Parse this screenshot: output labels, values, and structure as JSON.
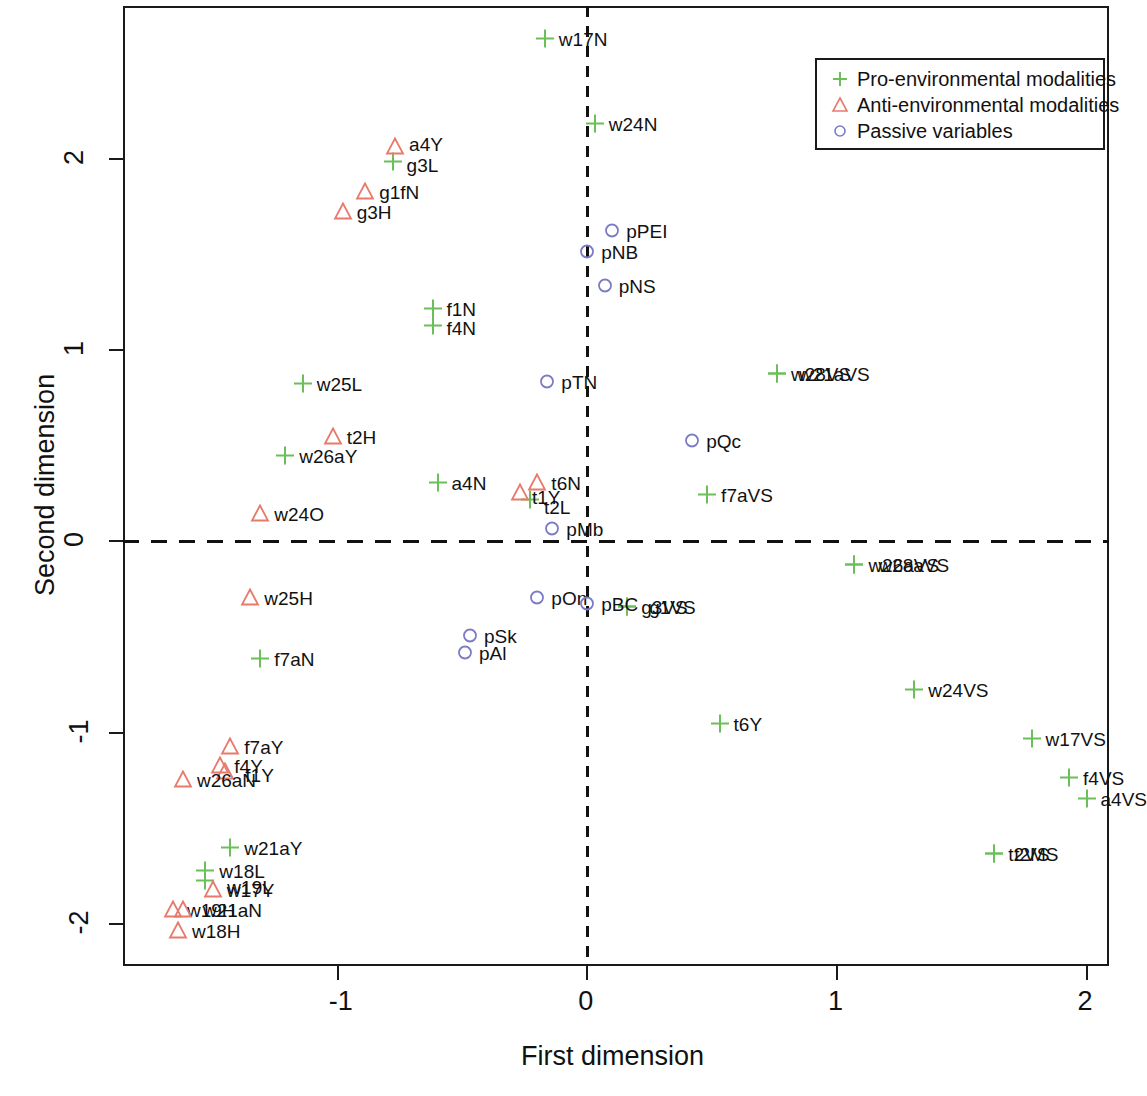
{
  "chart_data": {
    "type": "scatter",
    "title": "",
    "xlabel": "First dimension",
    "ylabel": "Second dimension",
    "xlim": [
      -1.86,
      2.09
    ],
    "ylim": [
      -2.22,
      2.8
    ],
    "xticks": [
      -1,
      0,
      1,
      2
    ],
    "xticklabels": [
      "-1",
      "0",
      "1",
      "2"
    ],
    "yticks": [
      -2,
      -1,
      0,
      1,
      2
    ],
    "yticklabels": [
      "-2",
      "-1",
      "0",
      "1",
      "2"
    ],
    "grid": false,
    "reference_lines": [
      {
        "axis": "vertical",
        "value": 0,
        "style": "dashed"
      },
      {
        "axis": "horizontal",
        "value": 0,
        "style": "dashed"
      }
    ],
    "legend": {
      "position": "top-right",
      "entries": [
        {
          "label": "Pro-environmental modalities",
          "marker": "plus",
          "color": "#6BBF59"
        },
        {
          "label": "Anti-environmental modalities",
          "marker": "triangle",
          "color": "#E8796B"
        },
        {
          "label": "Passive variables",
          "marker": "circle",
          "color": "#7B7BC8"
        }
      ]
    },
    "series": [
      {
        "name": "Pro-environmental modalities",
        "marker": "plus",
        "color": "#6BBF59",
        "points": [
          {
            "label": "w17N",
            "x": -0.17,
            "y": 2.62,
            "lx": 14,
            "ly": -1
          },
          {
            "label": "w24N",
            "x": 0.03,
            "y": 2.18,
            "lx": 14,
            "ly": -1
          },
          {
            "label": "g3L",
            "x": -0.78,
            "y": 1.98,
            "lx": 14,
            "ly": 2
          },
          {
            "label": "f1N",
            "x": -0.62,
            "y": 1.21,
            "lx": 14,
            "ly": -1
          },
          {
            "label": "f4N",
            "x": -0.62,
            "y": 1.12,
            "lx": 14,
            "ly": 1
          },
          {
            "label": "w25L",
            "x": -1.14,
            "y": 0.82,
            "lx": 14,
            "ly": -1
          },
          {
            "label": "w28VS",
            "x": 0.76,
            "y": 0.87,
            "lx": 14,
            "ly": -1
          },
          {
            "label": "w21aVS",
            "x": 0.76,
            "y": 0.87,
            "lx": 22,
            "ly": -1
          },
          {
            "label": "w26aY",
            "x": -1.21,
            "y": 0.44,
            "lx": 14,
            "ly": -1
          },
          {
            "label": "a4N",
            "x": -0.6,
            "y": 0.3,
            "lx": 14,
            "ly": -1
          },
          {
            "label": "t2L",
            "x": -0.23,
            "y": 0.21,
            "lx": 14,
            "ly": 6
          },
          {
            "label": "f7aVS",
            "x": 0.48,
            "y": 0.24,
            "lx": 14,
            "ly": -1
          },
          {
            "label": "w26aVS",
            "x": 1.07,
            "y": -0.13,
            "lx": 14,
            "ly": -1
          },
          {
            "label": "w28aVS",
            "x": 1.07,
            "y": -0.13,
            "lx": 24,
            "ly": -1
          },
          {
            "label": "g3VS",
            "x": 0.16,
            "y": -0.35,
            "lx": 14,
            "ly": -1
          },
          {
            "label": "g1VS",
            "x": 0.16,
            "y": -0.35,
            "lx": 22,
            "ly": -1
          },
          {
            "label": "f7aN",
            "x": -1.31,
            "y": -0.62,
            "lx": 14,
            "ly": -1
          },
          {
            "label": "w24VS",
            "x": 1.31,
            "y": -0.78,
            "lx": 14,
            "ly": -1
          },
          {
            "label": "t6Y",
            "x": 0.53,
            "y": -0.96,
            "lx": 14,
            "ly": -1
          },
          {
            "label": "w17VS",
            "x": 1.78,
            "y": -1.04,
            "lx": 14,
            "ly": -1
          },
          {
            "label": "f4VS",
            "x": 1.93,
            "y": -1.24,
            "lx": 14,
            "ly": -1
          },
          {
            "label": "a4VS",
            "x": 2.0,
            "y": -1.35,
            "lx": 14,
            "ly": -1
          },
          {
            "label": "w21aY",
            "x": -1.43,
            "y": -1.61,
            "lx": 14,
            "ly": -1
          },
          {
            "label": "w18L",
            "x": -1.53,
            "y": -1.73,
            "lx": 14,
            "ly": -1
          },
          {
            "label": "w19L",
            "x": -1.53,
            "y": -1.78,
            "lx": 22,
            "ly": 5
          },
          {
            "label": "t2VS",
            "x": 1.63,
            "y": -1.64,
            "lx": 14,
            "ly": -1
          },
          {
            "label": "t2MS",
            "x": 1.63,
            "y": -1.64,
            "lx": 20,
            "ly": -1
          }
        ]
      },
      {
        "name": "Anti-environmental modalities",
        "marker": "triangle",
        "color": "#E8796B",
        "points": [
          {
            "label": "a4Y",
            "x": -0.77,
            "y": 2.06,
            "lx": 14,
            "ly": -4
          },
          {
            "label": "g1fN",
            "x": -0.89,
            "y": 1.82,
            "lx": 14,
            "ly": -1
          },
          {
            "label": "g3H",
            "x": -0.98,
            "y": 1.72,
            "lx": 14,
            "ly": -1
          },
          {
            "label": "t2H",
            "x": -1.02,
            "y": 0.54,
            "lx": 14,
            "ly": -1
          },
          {
            "label": "t6N",
            "x": -0.2,
            "y": 0.3,
            "lx": 14,
            "ly": -1
          },
          {
            "label": "t1Y",
            "x": -0.27,
            "y": 0.25,
            "lx": 12,
            "ly": 3
          },
          {
            "label": "w24O",
            "x": -1.31,
            "y": 0.14,
            "lx": 14,
            "ly": -1
          },
          {
            "label": "w25H",
            "x": -1.35,
            "y": -0.3,
            "lx": 14,
            "ly": -1
          },
          {
            "label": "f7aY",
            "x": -1.43,
            "y": -1.08,
            "lx": 14,
            "ly": -1
          },
          {
            "label": "f4Y",
            "x": -1.47,
            "y": -1.18,
            "lx": 14,
            "ly": -1
          },
          {
            "label": "f1Y",
            "x": -1.45,
            "y": -1.21,
            "lx": 20,
            "ly": 2
          },
          {
            "label": "w26aN",
            "x": -1.62,
            "y": -1.25,
            "lx": 14,
            "ly": -1
          },
          {
            "label": "w17Y",
            "x": -1.5,
            "y": -1.83,
            "lx": 14,
            "ly": -1
          },
          {
            "label": "w19H",
            "x": -1.66,
            "y": -1.93,
            "lx": 14,
            "ly": -1
          },
          {
            "label": "w21aN",
            "x": -1.62,
            "y": -1.93,
            "lx": 20,
            "ly": -1
          },
          {
            "label": "w18H",
            "x": -1.64,
            "y": -2.04,
            "lx": 14,
            "ly": -1
          }
        ]
      },
      {
        "name": "Passive variables",
        "marker": "circle",
        "color": "#7B7BC8",
        "points": [
          {
            "label": "pPEI",
            "x": 0.1,
            "y": 1.62,
            "lx": 14,
            "ly": -1
          },
          {
            "label": "pNB",
            "x": 0.0,
            "y": 1.51,
            "lx": 14,
            "ly": -1
          },
          {
            "label": "pNS",
            "x": 0.07,
            "y": 1.33,
            "lx": 14,
            "ly": -1
          },
          {
            "label": "pTN",
            "x": -0.16,
            "y": 0.83,
            "lx": 14,
            "ly": -1
          },
          {
            "label": "pQc",
            "x": 0.42,
            "y": 0.52,
            "lx": 14,
            "ly": -1
          },
          {
            "label": "pMb",
            "x": -0.14,
            "y": 0.06,
            "lx": 14,
            "ly": -1
          },
          {
            "label": "pOn",
            "x": -0.2,
            "y": -0.3,
            "lx": 14,
            "ly": -1
          },
          {
            "label": "pBC",
            "x": 0.0,
            "y": -0.33,
            "lx": 14,
            "ly": -1
          },
          {
            "label": "pSk",
            "x": -0.47,
            "y": -0.5,
            "lx": 14,
            "ly": -1
          },
          {
            "label": "pAl",
            "x": -0.49,
            "y": -0.59,
            "lx": 14,
            "ly": -1
          }
        ]
      }
    ]
  }
}
